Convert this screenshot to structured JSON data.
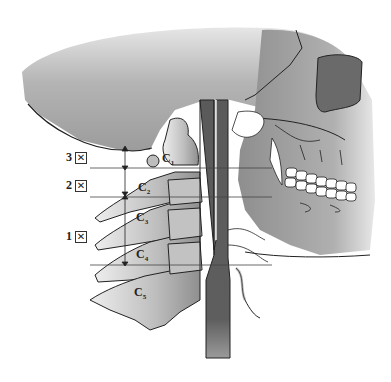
{
  "diagram": {
    "level_labels": [
      {
        "number": "3",
        "icon": "boxed-x-icon",
        "symbol": "☒"
      },
      {
        "number": "2",
        "icon": "boxed-x-icon",
        "symbol": "☒"
      },
      {
        "number": "1",
        "icon": "boxed-x-icon",
        "symbol": "☒"
      }
    ],
    "vertebrae": [
      {
        "base": "C",
        "sub": "1"
      },
      {
        "base": "C",
        "sub": "2"
      },
      {
        "base": "C",
        "sub": "3"
      },
      {
        "base": "C",
        "sub": "4"
      },
      {
        "base": "C",
        "sub": "5"
      }
    ],
    "colors": {
      "skull": "#9a9a9a",
      "skull_light": "#c8c8c8",
      "bone": "#b5b5b5",
      "tube": "#5e5e5e",
      "outline": "#222222",
      "orbit": "#6a6a6a",
      "teeth": "#ffffff"
    }
  }
}
